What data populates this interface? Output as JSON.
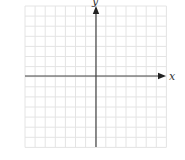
{
  "diagram": {
    "type": "cartesian-coordinate-grid",
    "x_axis_label": "x",
    "y_axis_label": "y",
    "grid": {
      "columns": 14,
      "rows": 14,
      "left": 25,
      "top": 6,
      "cell_size": 10.1,
      "line_color": "#e4e4e4"
    },
    "axes": {
      "origin_x": 96,
      "origin_y": 76,
      "color": "#444444"
    }
  }
}
